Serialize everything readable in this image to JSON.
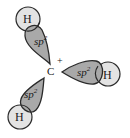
{
  "diagram": {
    "central_atom": {
      "label": "C",
      "charge": "+"
    },
    "orbitals": [
      {
        "id": "upper-left",
        "hybrid": "sp",
        "superscript": "2",
        "bonded_atom": "H"
      },
      {
        "id": "right",
        "hybrid": "sp",
        "superscript": "2",
        "bonded_atom": "H"
      },
      {
        "id": "lower-left",
        "hybrid": "sp",
        "superscript": "2",
        "bonded_atom": "H"
      }
    ],
    "colors": {
      "lobe_fill": "#a9a9a9",
      "hydrogen_fill": "#e3e3e3",
      "outline": "#2a2a2a"
    }
  }
}
